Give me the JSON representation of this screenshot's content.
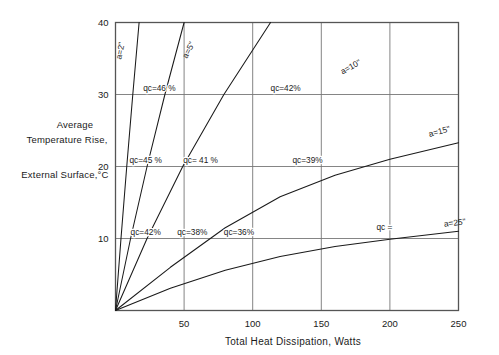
{
  "chart_data": {
    "type": "line",
    "title": "",
    "xlabel": "Total Heat Dissipation, Watts",
    "ylabel_lines": [
      "Average",
      "Temperature Rise,",
      "External Surface,°C"
    ],
    "xlim": [
      0,
      250
    ],
    "ylim": [
      0,
      40
    ],
    "xticks": [
      0,
      50,
      100,
      150,
      200,
      250
    ],
    "xticklabels": [
      "",
      "50",
      "100",
      "150",
      "200",
      "250"
    ],
    "yticks": [
      0,
      10,
      20,
      30,
      40
    ],
    "yticklabels": [
      "",
      "10",
      "20",
      "30",
      "40"
    ],
    "grid": true,
    "grid_note": "solid thin gridlines at y=10,20,30 and x=50,100,150,200",
    "legend": "inline curve labels",
    "series": [
      {
        "name": "a=2\"",
        "label": "a=2\"",
        "label_x": 123,
        "label_y": 36,
        "label_rotation": -79,
        "points": [
          [
            0,
            0
          ],
          [
            4,
            10
          ],
          [
            8.2,
            20
          ],
          [
            12.6,
            30
          ],
          [
            17.2,
            40
          ]
        ]
      },
      {
        "name": "a=5\"",
        "label": "a=5\"",
        "label_x": 191,
        "label_y": 36,
        "label_rotation": -63,
        "points": [
          [
            0,
            0
          ],
          [
            11,
            10
          ],
          [
            23,
            20
          ],
          [
            36,
            30
          ],
          [
            50,
            40
          ]
        ]
      },
      {
        "name": "a=10\"",
        "label": "a=10\"",
        "label_x": 352,
        "label_y": 33.5,
        "label_rotation": -29,
        "points": [
          [
            0,
            0
          ],
          [
            23,
            10
          ],
          [
            49,
            20
          ],
          [
            79,
            30
          ],
          [
            113,
            40
          ]
        ]
      },
      {
        "name": "a=15\"",
        "label": "a=15\"",
        "label_x": 440,
        "label_y": 24.5,
        "label_rotation": -15,
        "points": [
          [
            0,
            0
          ],
          [
            40,
            6
          ],
          [
            80,
            11.5
          ],
          [
            120,
            15.8
          ],
          [
            160,
            18.8
          ],
          [
            200,
            21
          ],
          [
            250,
            23.3
          ]
        ]
      },
      {
        "name": "a=25\"",
        "label": "a=25\"",
        "label_x": 455,
        "label_y": 11.8,
        "label_rotation": -7,
        "points": [
          [
            0,
            0
          ],
          [
            40,
            3.1
          ],
          [
            80,
            5.6
          ],
          [
            120,
            7.5
          ],
          [
            160,
            8.9
          ],
          [
            200,
            9.9
          ],
          [
            250,
            11.0
          ]
        ]
      }
    ],
    "annotations": [
      {
        "text": "qᴄ=42%",
        "x": 22,
        "y": 10,
        "name": "qc-42-lower"
      },
      {
        "text": "qᴄ=38%",
        "x": 56,
        "y": 10,
        "name": "qc-38"
      },
      {
        "text": "qᴄ=36%",
        "x": 90,
        "y": 10,
        "name": "qc-36"
      },
      {
        "text": "qᴄ=45 %",
        "x": 22,
        "y": 20,
        "name": "qc-45"
      },
      {
        "text": "qᴄ= 41 %",
        "x": 62,
        "y": 20,
        "name": "qc-41"
      },
      {
        "text": "qᴄ=39%",
        "x": 140,
        "y": 20,
        "name": "qc-39"
      },
      {
        "text": "qᴄ=46 %",
        "x": 32,
        "y": 30,
        "name": "qc-46"
      },
      {
        "text": "qᴄ=42%",
        "x": 124,
        "y": 30,
        "name": "qc-42-upper"
      },
      {
        "text": "qᴄ =",
        "x": 196,
        "y": 10.6,
        "name": "qc-blank"
      }
    ],
    "colors": {
      "background": "#ffffff",
      "axis": "#555555",
      "grid": "#777777",
      "curve": "#1a1a1a",
      "text": "#1a1a1a"
    }
  }
}
